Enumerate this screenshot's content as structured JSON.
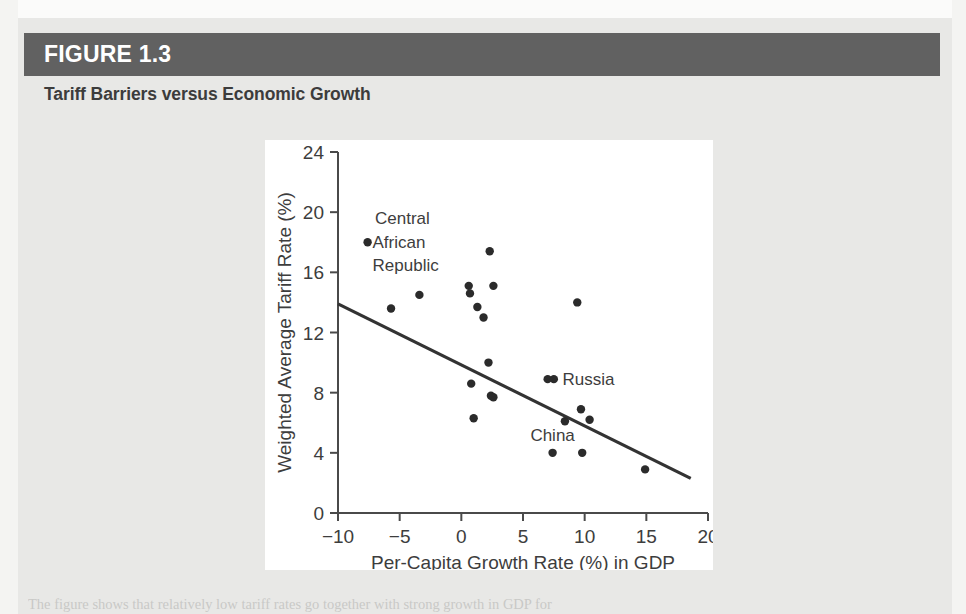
{
  "figure": {
    "number": "FIGURE 1.3",
    "title": "Tariff Barriers versus Economic Growth",
    "caption": "The figure shows that relatively low tariff rates go together with strong growth in GDP for"
  },
  "colors": {
    "header_band": "#616161",
    "page_background": "#e8e8e6",
    "panel_background": "#ffffff",
    "marker": "#2b2b2b",
    "trendline": "#333333",
    "axis": "#4a4a4a",
    "text": "#3d3d3d",
    "header_text": "#ffffff"
  },
  "chart_data": {
    "type": "scatter",
    "title": "Tariff Barriers versus Economic Growth",
    "xlabel": "Per-Capita Growth Rate (%) in GDP",
    "ylabel": "Weighted Average Tariff Rate (%)",
    "xlim": [
      -10,
      20
    ],
    "ylim": [
      0,
      24
    ],
    "xticks": [
      "-10",
      "-5",
      "0",
      "5",
      "10",
      "15",
      "20"
    ],
    "xtick_values": [
      -10,
      -5,
      0,
      5,
      10,
      15,
      20
    ],
    "yticks": [
      "0",
      "4",
      "8",
      "12",
      "16",
      "20",
      "24"
    ],
    "ytick_values": [
      0,
      4,
      8,
      12,
      16,
      20,
      24
    ],
    "grid": false,
    "legend": "none",
    "points": [
      {
        "x": -7.6,
        "y": 18.0,
        "label": "Central African Republic"
      },
      {
        "x": -5.7,
        "y": 13.6,
        "label": ""
      },
      {
        "x": -3.4,
        "y": 14.5,
        "label": ""
      },
      {
        "x": 0.6,
        "y": 15.1,
        "label": ""
      },
      {
        "x": 0.7,
        "y": 14.6,
        "label": ""
      },
      {
        "x": 1.3,
        "y": 13.7,
        "label": ""
      },
      {
        "x": 1.8,
        "y": 13.0,
        "label": ""
      },
      {
        "x": 2.3,
        "y": 17.4,
        "label": ""
      },
      {
        "x": 2.6,
        "y": 15.1,
        "label": ""
      },
      {
        "x": 9.4,
        "y": 14.0,
        "label": ""
      },
      {
        "x": 2.2,
        "y": 10.0,
        "label": ""
      },
      {
        "x": 0.8,
        "y": 8.6,
        "label": ""
      },
      {
        "x": 2.4,
        "y": 7.8,
        "label": ""
      },
      {
        "x": 2.6,
        "y": 7.7,
        "label": ""
      },
      {
        "x": 1.0,
        "y": 6.3,
        "label": ""
      },
      {
        "x": 7.0,
        "y": 8.9,
        "label": "Russia"
      },
      {
        "x": 7.5,
        "y": 8.9,
        "label": ""
      },
      {
        "x": 9.7,
        "y": 6.9,
        "label": ""
      },
      {
        "x": 8.4,
        "y": 6.1,
        "label": "China"
      },
      {
        "x": 10.4,
        "y": 6.2,
        "label": ""
      },
      {
        "x": 7.4,
        "y": 4.0,
        "label": ""
      },
      {
        "x": 9.8,
        "y": 4.0,
        "label": ""
      },
      {
        "x": 14.9,
        "y": 2.9,
        "label": ""
      }
    ],
    "trendline": {
      "x0": -10.0,
      "y0": 13.9,
      "x1": 18.6,
      "y1": 2.3
    },
    "annotations": [
      {
        "text": "Central",
        "x": -7.0,
        "y": 19.6
      },
      {
        "text": "African",
        "x": -7.2,
        "y": 18.0
      },
      {
        "text": "Republic",
        "x": -7.2,
        "y": 16.5
      },
      {
        "text": "Russia",
        "x": 8.2,
        "y": 8.9
      },
      {
        "text": "China",
        "x": 5.6,
        "y": 5.2
      }
    ]
  }
}
